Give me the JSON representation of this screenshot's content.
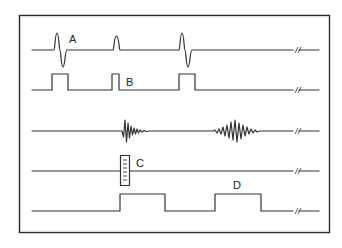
{
  "diagram": {
    "type": "timing-waveform-diagram",
    "rows": [
      {
        "id": "A",
        "label": "A",
        "description": "biphasic pulse signal with three events (large, small, large)"
      },
      {
        "id": "B",
        "label": "B",
        "description": "rectangular gating pulses aligned to row A events"
      },
      {
        "id": "echo",
        "label": "",
        "description": "oscillatory burst signals (short decaying burst, longer spindle burst)"
      },
      {
        "id": "C",
        "label": "C",
        "description": "baseline with boxed scale marker"
      },
      {
        "id": "D",
        "label": "D",
        "description": "rectangular window pulses aligned to the bursts"
      }
    ],
    "break_symbol": "//",
    "colors": {
      "line": "#333333",
      "frame": "#2a2a2a",
      "background": "#ffffff"
    }
  }
}
